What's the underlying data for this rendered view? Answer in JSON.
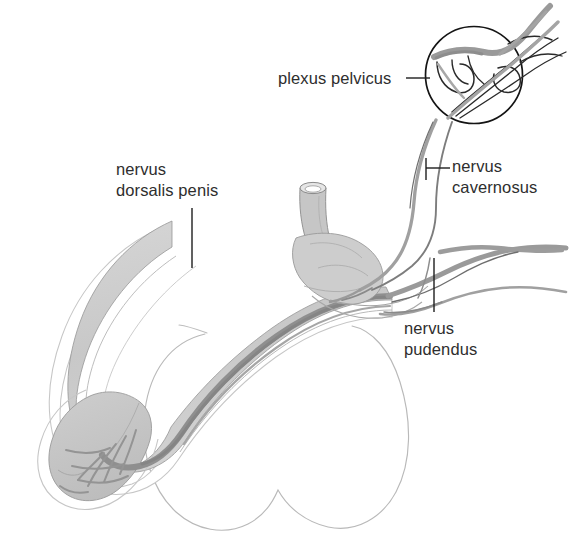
{
  "figure": {
    "kind": "anatomical-line-diagram",
    "background_color": "#ffffff"
  },
  "labels": [
    {
      "id": "plexus-pelvicus",
      "lines": [
        "plexus pelvicus"
      ],
      "text": "plexus pelvicus",
      "leader": "horizontal-dash-right"
    },
    {
      "id": "nervus-cavernosus",
      "lines": [
        "nervus",
        "cavernosus"
      ],
      "line1": "nervus",
      "line2": "cavernosus",
      "leader": "bracket-left"
    },
    {
      "id": "nervus-dorsalis-penis",
      "lines": [
        "nervus",
        "dorsalis penis"
      ],
      "line1": "nervus",
      "line2": "dorsalis penis",
      "leader": "vertical-down"
    },
    {
      "id": "nervus-pudendus",
      "lines": [
        "nervus",
        "pudendus"
      ],
      "line1": "nervus",
      "line2": "pudendus",
      "leader": "vertical-up"
    }
  ],
  "colors": {
    "text": "#2e2e2e",
    "leader_line": "#1e1e1e",
    "outline": "#7a7a7a",
    "faint_outline": "#b9b9b9",
    "shaft_fill": "#cbcbcb",
    "glans_fill": "#c2c2c2",
    "nerve_dark": "#8f8f8f",
    "nerve_mid": "#9c9c9c",
    "plexus_circle": "#141414"
  },
  "structures": [
    {
      "id": "penis-shaft",
      "name": "corpus penis (shaft)",
      "fill": "#cbcbcb"
    },
    {
      "id": "glans-penis",
      "name": "glans penis",
      "fill": "#c2c2c2"
    },
    {
      "id": "urethra-stump",
      "name": "urethra stump",
      "fill": "#c4c4c4"
    },
    {
      "id": "scrotum-outline",
      "name": "scrotum outline",
      "fill": "none"
    },
    {
      "id": "dorsal-nerve-band",
      "name": "nervus dorsalis penis",
      "fill": "#8f8f8f"
    },
    {
      "id": "glans-nerve-fibers",
      "name": "glans nerve fibers",
      "fill": "none"
    },
    {
      "id": "plexus-circle",
      "name": "plexus pelvicus circle",
      "fill": "none"
    },
    {
      "id": "plexus-fibers",
      "name": "plexus pelvicus fibers",
      "fill": "none"
    },
    {
      "id": "cavernous-nerve-trunks",
      "name": "nervi cavernosi",
      "fill": "none"
    },
    {
      "id": "pudendal-nerve",
      "name": "nervus pudendus",
      "fill": "none"
    }
  ]
}
